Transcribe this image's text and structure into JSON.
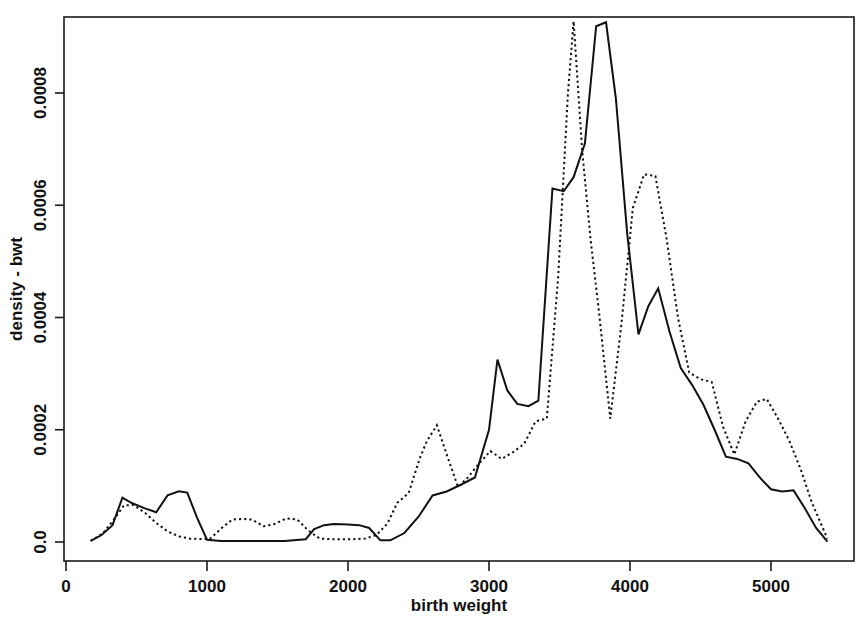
{
  "chart_data": {
    "type": "line",
    "title": "",
    "xlabel": "birth weight",
    "ylabel": "density - bwt",
    "xlim": [
      -180,
      5600
    ],
    "ylim": [
      -2e-05,
      0.000965
    ],
    "grid": false,
    "legend": "none",
    "xticks": [
      0,
      1000,
      2000,
      3000,
      4000,
      5000
    ],
    "xtick_labels": [
      "0",
      "1000",
      "2000",
      "3000",
      "4000",
      "5000"
    ],
    "yticks": [
      0.0,
      0.0002,
      0.0004,
      0.0006,
      0.0008
    ],
    "ytick_labels": [
      "0.0",
      "0.0002",
      "0.0004",
      "0.0006",
      "0.0008"
    ],
    "series": [
      {
        "name": "solid",
        "style": "solid",
        "color": "#111111",
        "x": [
          175,
          250,
          330,
          400,
          470,
          560,
          640,
          720,
          800,
          860,
          930,
          1000,
          1100,
          1250,
          1400,
          1550,
          1700,
          1760,
          1830,
          1900,
          2000,
          2080,
          2150,
          2230,
          2300,
          2400,
          2500,
          2600,
          2700,
          2800,
          2900,
          3000,
          3060,
          3130,
          3200,
          3280,
          3350,
          3450,
          3530,
          3600,
          3680,
          3760,
          3830,
          3900,
          3980,
          4060,
          4130,
          4200,
          4280,
          4360,
          4440,
          4520,
          4600,
          4680,
          4760,
          4840,
          4920,
          5000,
          5080,
          5160,
          5240,
          5320,
          5400
        ],
        "y": [
          2e-06,
          1.2e-05,
          3e-05,
          7.9e-05,
          6.9e-05,
          6e-05,
          5.3e-05,
          8.3e-05,
          9.05e-05,
          8.8e-05,
          4.3e-05,
          4e-06,
          2e-06,
          2e-06,
          2e-06,
          2e-06,
          5e-06,
          2.3e-05,
          3e-05,
          3.2e-05,
          3.1e-05,
          3e-05,
          2.5e-05,
          3e-06,
          3e-06,
          1.6e-05,
          4.5e-05,
          8.3e-05,
          9e-05,
          0.000102,
          0.000115,
          0.0002,
          0.000325,
          0.00027,
          0.000246,
          0.000242,
          0.000252,
          0.00063,
          0.000625,
          0.00065,
          0.00071,
          0.000919,
          0.000926,
          0.00079,
          0.00055,
          0.00037,
          0.00042,
          0.000452,
          0.000375,
          0.00031,
          0.00028,
          0.000245,
          0.0002,
          0.000152,
          0.000148,
          0.00014,
          0.000115,
          9.4e-05,
          9e-05,
          9.2e-05,
          6e-05,
          2.5e-05,
          5e-07
        ]
      },
      {
        "name": "dotted",
        "style": "dotted",
        "color": "#111111",
        "x": [
          175,
          260,
          340,
          410,
          480,
          560,
          640,
          720,
          800,
          880,
          950,
          1020,
          1100,
          1180,
          1250,
          1320,
          1400,
          1480,
          1560,
          1640,
          1720,
          1800,
          1880,
          1960,
          2040,
          2120,
          2200,
          2280,
          2350,
          2430,
          2510,
          2560,
          2630,
          2700,
          2780,
          2850,
          2930,
          3010,
          3090,
          3170,
          3250,
          3330,
          3410,
          3490,
          3560,
          3600,
          3660,
          3720,
          3780,
          3860,
          3940,
          4020,
          4100,
          4180,
          4260,
          4340,
          4420,
          4500,
          4580,
          4660,
          4740,
          4820,
          4900,
          4970,
          5050,
          5130,
          5210,
          5290,
          5400
        ],
        "y": [
          2e-06,
          1.5e-05,
          4e-05,
          6.5e-05,
          6.6e-05,
          5.2e-05,
          3.4e-05,
          1.9e-05,
          1e-05,
          6e-06,
          5.5e-06,
          5.5e-06,
          2.4e-05,
          4e-05,
          4.1e-05,
          4e-05,
          2.8e-05,
          3.2e-05,
          4.2e-05,
          4e-05,
          2e-05,
          6e-06,
          5e-06,
          5e-06,
          5e-06,
          6e-06,
          1.2e-05,
          3.3e-05,
          7e-05,
          8.7e-05,
          0.00015,
          0.00018,
          0.000208,
          0.000156,
          9.8e-05,
          0.000115,
          0.00014,
          0.000162,
          0.000148,
          0.00016,
          0.000175,
          0.000215,
          0.00022,
          0.00047,
          0.0008,
          0.000928,
          0.0007,
          0.00054,
          0.00041,
          0.00022,
          0.00039,
          0.000595,
          0.000655,
          0.000652,
          0.00054,
          0.0004,
          0.000302,
          0.00029,
          0.000285,
          0.000205,
          0.000156,
          0.000215,
          0.00025,
          0.000255,
          0.00022,
          0.00018,
          0.00013,
          7e-05,
          6e-06
        ]
      }
    ]
  },
  "axes": {
    "x_title": "birth weight",
    "y_title": "density - bwt"
  }
}
